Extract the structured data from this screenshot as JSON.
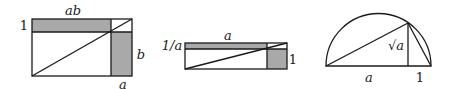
{
  "figures": [
    {
      "name": "rectangle-ab",
      "labels": {
        "top": "ab",
        "left": "1",
        "right": "b",
        "bottom": "a"
      }
    },
    {
      "name": "rectangle-reciprocal",
      "labels": {
        "top": "a",
        "left": "1/a",
        "right": "1"
      }
    },
    {
      "name": "semicircle-sqrt",
      "labels": {
        "height": "√a",
        "base_left": "a",
        "base_right": "1"
      }
    }
  ],
  "colors": {
    "stroke": "#1a1a1a",
    "shade": "#a9a9a9",
    "background": "#ffffff"
  }
}
